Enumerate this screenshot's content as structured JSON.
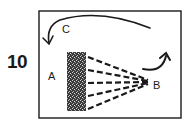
{
  "figure": {
    "number": "10",
    "labels": {
      "a": "A",
      "b": "B",
      "c": "C"
    }
  },
  "colors": {
    "ink": "#1a1a1a",
    "background": "#ffffff",
    "texture": "#555555"
  },
  "elements": [
    {
      "id": "frame",
      "type": "rectangle",
      "description": "hand-drawn border"
    },
    {
      "id": "block",
      "type": "stippled-rectangle",
      "description": "dark textured vertical block"
    },
    {
      "id": "rays",
      "type": "dashed-lines",
      "count": 5,
      "from": "block",
      "to": "B"
    },
    {
      "id": "arrow-b",
      "type": "curved-arrow",
      "near": "B",
      "direction": "up"
    },
    {
      "id": "arrow-c",
      "type": "curved-arrow",
      "near": "C",
      "direction": "left-down"
    }
  ]
}
